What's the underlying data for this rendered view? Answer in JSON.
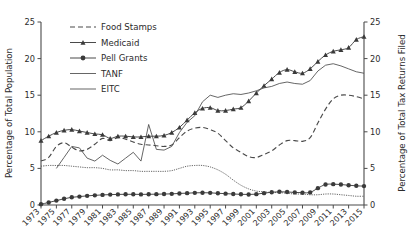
{
  "chart_data": {
    "type": "line",
    "title": "",
    "xlabel": "",
    "ylabel": "Percentage of Total Population",
    "y2label": "Percentage of Total Tax Returns Filed",
    "xlim": [
      1973,
      2015
    ],
    "ylim": [
      0,
      25
    ],
    "y2lim": [
      0,
      25
    ],
    "yticks": [
      0,
      5,
      10,
      15,
      20,
      25
    ],
    "y2ticks": [
      0,
      5,
      10,
      15,
      20,
      25
    ],
    "grid": false,
    "legend_position": "top-left",
    "xticklabels": [
      "1973",
      "1975",
      "1977",
      "1979",
      "1981",
      "1983",
      "1985",
      "1987",
      "1989",
      "1991",
      "1993",
      "1995",
      "1997",
      "1999",
      "2001",
      "2003",
      "2005",
      "2007",
      "2009",
      "2011",
      "2013",
      "2015"
    ],
    "x": [
      1973,
      1974,
      1975,
      1976,
      1977,
      1978,
      1979,
      1980,
      1981,
      1982,
      1983,
      1984,
      1985,
      1986,
      1987,
      1988,
      1989,
      1990,
      1991,
      1992,
      1993,
      1994,
      1995,
      1996,
      1997,
      1998,
      1999,
      2000,
      2001,
      2002,
      2003,
      2004,
      2005,
      2006,
      2007,
      2008,
      2009,
      2010,
      2011,
      2012,
      2013,
      2014,
      2015
    ],
    "series": [
      {
        "name": "Food Stamps",
        "style": "dashed",
        "marker": "none",
        "axis": "left",
        "values": [
          6.0,
          6.5,
          8.0,
          8.5,
          7.9,
          7.4,
          7.6,
          8.3,
          9.1,
          8.8,
          9.2,
          9.0,
          8.6,
          8.3,
          8.2,
          8.1,
          8.0,
          8.2,
          9.2,
          10.1,
          10.5,
          10.6,
          10.3,
          9.8,
          8.8,
          7.8,
          7.2,
          6.6,
          6.5,
          6.9,
          7.4,
          8.2,
          8.8,
          8.8,
          8.7,
          9.2,
          11.2,
          13.1,
          14.5,
          15.0,
          15.0,
          14.8,
          14.5
        ]
      },
      {
        "name": "Medicaid",
        "style": "solid",
        "marker": "triangle",
        "axis": "left",
        "values": [
          8.8,
          9.4,
          9.9,
          10.2,
          10.3,
          10.1,
          9.9,
          9.7,
          9.6,
          9.1,
          9.4,
          9.4,
          9.3,
          9.3,
          9.4,
          9.4,
          9.5,
          9.9,
          10.6,
          11.6,
          12.6,
          13.2,
          13.3,
          12.9,
          12.9,
          13.1,
          13.3,
          14.2,
          15.3,
          16.3,
          17.2,
          18.1,
          18.5,
          18.2,
          18.0,
          18.6,
          19.6,
          20.5,
          21.0,
          21.2,
          21.5,
          22.6,
          23.0
        ]
      },
      {
        "name": "Pell Grants",
        "style": "solid",
        "marker": "circle",
        "axis": "left",
        "values": [
          0.1,
          0.35,
          0.6,
          0.85,
          1.05,
          1.15,
          1.25,
          1.32,
          1.38,
          1.42,
          1.45,
          1.46,
          1.46,
          1.45,
          1.46,
          1.48,
          1.5,
          1.52,
          1.58,
          1.62,
          1.66,
          1.68,
          1.66,
          1.6,
          1.55,
          1.5,
          1.46,
          1.44,
          1.48,
          1.62,
          1.75,
          1.8,
          1.78,
          1.72,
          1.68,
          1.72,
          2.3,
          2.8,
          2.85,
          2.8,
          2.7,
          2.62,
          2.58
        ]
      },
      {
        "name": "TANF",
        "style": "dotted",
        "marker": "none",
        "axis": "left",
        "values": [
          5.3,
          5.4,
          5.4,
          5.4,
          5.3,
          5.2,
          5.1,
          5.1,
          5.0,
          4.8,
          4.8,
          4.7,
          4.7,
          4.6,
          4.6,
          4.6,
          4.6,
          4.7,
          5.0,
          5.3,
          5.4,
          5.4,
          5.2,
          4.8,
          4.2,
          3.4,
          2.7,
          2.2,
          1.9,
          1.8,
          1.7,
          1.7,
          1.6,
          1.5,
          1.5,
          1.4,
          1.4,
          1.5,
          1.5,
          1.4,
          1.3,
          1.2,
          1.2
        ]
      },
      {
        "name": "EITC",
        "style": "solid",
        "marker": "none",
        "axis": "right",
        "values": [
          null,
          null,
          5.0,
          6.5,
          8.0,
          7.8,
          6.4,
          6.0,
          6.8,
          6.1,
          5.6,
          6.4,
          7.2,
          6.0,
          11.0,
          7.6,
          7.5,
          8.0,
          9.9,
          11.3,
          12.2,
          14.1,
          15.0,
          14.7,
          15.0,
          15.2,
          15.1,
          15.3,
          15.6,
          16.0,
          16.2,
          16.6,
          16.8,
          16.6,
          16.5,
          17.0,
          18.3,
          19.1,
          19.3,
          19.0,
          18.6,
          18.2,
          18.0
        ]
      }
    ]
  },
  "axes": {
    "left_title": "Percentage of Total Population",
    "right_title": "Percentage of Total Tax Returns Filed"
  },
  "legend": {
    "items": [
      {
        "label": "Food Stamps",
        "key": "food-stamps"
      },
      {
        "label": "Medicaid",
        "key": "medicaid"
      },
      {
        "label": "Pell Grants",
        "key": "pell-grants"
      },
      {
        "label": "TANF",
        "key": "tanf"
      },
      {
        "label": "EITC",
        "key": "eitc"
      }
    ]
  }
}
